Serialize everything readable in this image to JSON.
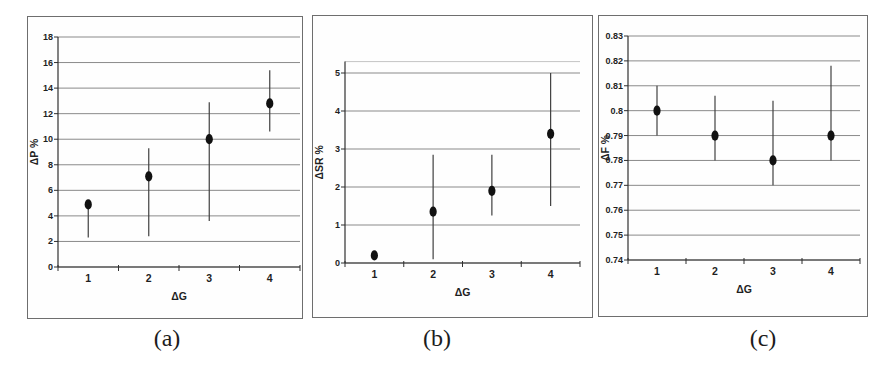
{
  "figure": {
    "captions": [
      {
        "label": "(a)"
      },
      {
        "label": "(b)"
      },
      {
        "label": "(c)"
      }
    ]
  },
  "colors": {
    "background": "#ffffff",
    "panel_border": "#6e6e6e",
    "gridline": "#8a8a8a",
    "plot_top_edge": "#c4c4c4",
    "axis": "#2f2f2f",
    "error_bar": "#404040",
    "marker": "#111111",
    "text": "#1f1f1f"
  },
  "chart_data": [
    {
      "type": "scatter",
      "panel": "a",
      "xlabel": "ΔG",
      "ylabel": "ΔP %",
      "x": [
        1,
        2,
        3,
        4
      ],
      "y": [
        4.9,
        7.1,
        10.0,
        12.8
      ],
      "err_lo": [
        2.3,
        2.4,
        3.6,
        10.6
      ],
      "err_hi": [
        5.2,
        9.3,
        12.9,
        15.4
      ],
      "xlim": [
        0.5,
        4.5
      ],
      "ylim": [
        0,
        18
      ],
      "yticks": [
        0,
        2,
        4,
        6,
        8,
        10,
        12,
        14,
        16,
        18
      ],
      "ytick_labels": [
        "0",
        "2",
        "4",
        "6",
        "8",
        "10",
        "12",
        "14",
        "16",
        "18"
      ],
      "xticks": [
        1,
        2,
        3,
        4
      ],
      "xtick_labels": [
        "1",
        "2",
        "3",
        "4"
      ],
      "grid": "horizontal",
      "legend": "none",
      "marker": "filled-ellipse"
    },
    {
      "type": "scatter",
      "panel": "b",
      "xlabel": "ΔG",
      "ylabel": "ΔSR %",
      "x": [
        1,
        2,
        3,
        4
      ],
      "y": [
        0.2,
        1.35,
        1.9,
        3.4
      ],
      "err_lo": [
        0.2,
        0.1,
        1.25,
        1.5
      ],
      "err_hi": [
        0.2,
        2.85,
        2.85,
        5.0
      ],
      "xlim": [
        0.5,
        4.5
      ],
      "ylim": [
        0,
        5.3
      ],
      "yticks": [
        0,
        1,
        2,
        3,
        4,
        5
      ],
      "ytick_labels": [
        "0",
        "1",
        "2",
        "3",
        "4",
        "5"
      ],
      "xticks": [
        1,
        2,
        3,
        4
      ],
      "xtick_labels": [
        "1",
        "2",
        "3",
        "4"
      ],
      "grid": "horizontal",
      "legend": "none",
      "marker": "filled-ellipse"
    },
    {
      "type": "scatter",
      "panel": "c",
      "xlabel": "ΔG",
      "ylabel": "ΔF %",
      "x": [
        1,
        2,
        3,
        4
      ],
      "y": [
        0.8,
        0.79,
        0.78,
        0.79
      ],
      "err_lo": [
        0.79,
        0.78,
        0.77,
        0.78
      ],
      "err_hi": [
        0.81,
        0.806,
        0.804,
        0.818
      ],
      "xlim": [
        0.5,
        4.5
      ],
      "ylim": [
        0.74,
        0.83
      ],
      "yticks": [
        0.74,
        0.75,
        0.76,
        0.77,
        0.78,
        0.79,
        0.8,
        0.81,
        0.82,
        0.83
      ],
      "ytick_labels": [
        "0.74",
        "0.75",
        "0.76",
        "0.77",
        "0.78",
        "0.79",
        "0.8",
        "0.81",
        "0.82",
        "0.83"
      ],
      "xticks": [
        1,
        2,
        3,
        4
      ],
      "xtick_labels": [
        "1",
        "2",
        "3",
        "4"
      ],
      "grid": "horizontal",
      "legend": "none",
      "marker": "filled-ellipse"
    }
  ]
}
